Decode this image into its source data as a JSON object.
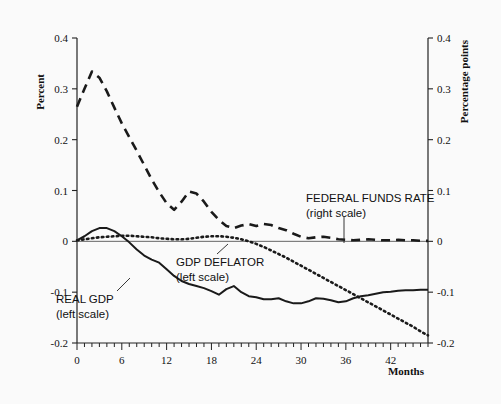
{
  "chart_data": {
    "type": "line",
    "title": "",
    "xlabel": "Months",
    "ylabel_left": "Percent",
    "ylabel_right": "Percentage points",
    "xlim": [
      0,
      47
    ],
    "ylim_left": [
      -0.2,
      0.4
    ],
    "ylim_right": [
      -0.2,
      0.4
    ],
    "grid": false,
    "legend_position": "inline-annotations",
    "x_ticks_major": [
      0,
      6,
      12,
      18,
      24,
      30,
      36,
      42
    ],
    "x_tick_labels": [
      "0",
      "6",
      "12",
      "18",
      "24",
      "30",
      "36",
      "42"
    ],
    "x_minor_tick_step": 1,
    "y_ticks_left": [
      0.4,
      0.3,
      0.2,
      0.1,
      0,
      -0.1,
      -0.2
    ],
    "y_tick_labels_left": [
      "0.4",
      "0.3",
      "0.2",
      "0.1",
      "0",
      "-0.1",
      "-0.2"
    ],
    "y_ticks_right": [
      0.4,
      0.3,
      0.2,
      0.1,
      0,
      -0.1,
      -0.2
    ],
    "y_tick_labels_right": [
      "0.4",
      "0.3",
      "0.2",
      "0.1",
      "0",
      "-0.1",
      "-0.2"
    ],
    "zero_line": 0,
    "x": [
      0,
      1,
      2,
      3,
      4,
      5,
      6,
      7,
      8,
      9,
      10,
      11,
      12,
      13,
      14,
      15,
      16,
      17,
      18,
      19,
      20,
      21,
      22,
      23,
      24,
      25,
      26,
      27,
      28,
      29,
      30,
      31,
      32,
      33,
      34,
      35,
      36,
      37,
      38,
      39,
      40,
      41,
      42,
      43,
      44,
      45,
      46,
      47
    ],
    "series": [
      {
        "name": "FEDERAL FUNDS RATE",
        "scale": "right",
        "style": "dashed",
        "color": "#1a1a1a",
        "label_line1": "FEDERAL FUNDS RATE",
        "label_line2": "(right scale)",
        "values": [
          0.265,
          0.3,
          0.334,
          0.322,
          0.295,
          0.263,
          0.232,
          0.205,
          0.178,
          0.15,
          0.122,
          0.097,
          0.075,
          0.062,
          0.078,
          0.098,
          0.094,
          0.078,
          0.058,
          0.042,
          0.03,
          0.026,
          0.031,
          0.034,
          0.03,
          0.034,
          0.032,
          0.026,
          0.022,
          0.015,
          0.009,
          0.006,
          0.008,
          0.009,
          0.007,
          0.004,
          0.003,
          0.002,
          0.003,
          0.004,
          0.003,
          0.002,
          0.002,
          0.003,
          0.002,
          0.002,
          0.001,
          0.001
        ]
      },
      {
        "name": "GDP DEFLATOR",
        "scale": "left",
        "style": "dotted",
        "color": "#1a1a1a",
        "label_line1": "GDP DEFLATOR",
        "label_line2": "(left scale)",
        "values": [
          0.002,
          0.004,
          0.006,
          0.008,
          0.009,
          0.01,
          0.011,
          0.011,
          0.01,
          0.009,
          0.008,
          0.006,
          0.005,
          0.004,
          0.004,
          0.005,
          0.007,
          0.009,
          0.01,
          0.01,
          0.009,
          0.007,
          0.004,
          0.0,
          -0.005,
          -0.011,
          -0.018,
          -0.025,
          -0.032,
          -0.04,
          -0.048,
          -0.056,
          -0.064,
          -0.072,
          -0.08,
          -0.088,
          -0.096,
          -0.104,
          -0.112,
          -0.12,
          -0.128,
          -0.136,
          -0.144,
          -0.152,
          -0.16,
          -0.168,
          -0.177,
          -0.185
        ]
      },
      {
        "name": "REAL GDP",
        "scale": "left",
        "style": "solid",
        "color": "#1a1a1a",
        "label_line1": "REAL GDP",
        "label_line2": "(left scale)",
        "values": [
          0.002,
          0.01,
          0.02,
          0.026,
          0.026,
          0.02,
          0.01,
          -0.002,
          -0.016,
          -0.028,
          -0.036,
          -0.042,
          -0.055,
          -0.068,
          -0.078,
          -0.084,
          -0.088,
          -0.092,
          -0.098,
          -0.105,
          -0.094,
          -0.088,
          -0.1,
          -0.108,
          -0.11,
          -0.114,
          -0.114,
          -0.112,
          -0.118,
          -0.122,
          -0.122,
          -0.118,
          -0.112,
          -0.113,
          -0.116,
          -0.12,
          -0.118,
          -0.112,
          -0.108,
          -0.106,
          -0.103,
          -0.1,
          -0.099,
          -0.097,
          -0.096,
          -0.096,
          -0.095,
          -0.095
        ]
      }
    ],
    "annotations": [
      {
        "text": "FEDERAL FUNDS RATE",
        "for": "FEDERAL FUNDS RATE"
      },
      {
        "text": "(right scale)",
        "for": "FEDERAL FUNDS RATE"
      },
      {
        "text": "GDP DEFLATOR",
        "for": "GDP DEFLATOR"
      },
      {
        "text": "(left scale)",
        "for": "GDP DEFLATOR"
      },
      {
        "text": "REAL GDP",
        "for": "REAL GDP"
      },
      {
        "text": "(left scale)",
        "for": "REAL GDP"
      }
    ]
  },
  "colors": {
    "ink": "#1a1a1a",
    "axis": "#222222",
    "background": "#fafafa"
  }
}
